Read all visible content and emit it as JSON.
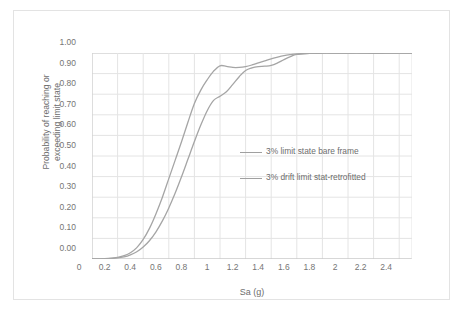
{
  "chart_data": {
    "type": "line",
    "title": "",
    "xlabel": "Sa (g)",
    "ylabel": "Probability of reaching or exceeding limit state",
    "ylabel_line1": "Probability of reaching or",
    "ylabel_line2": "exceeding limit state",
    "xlim": [
      0,
      2.5
    ],
    "ylim": [
      0,
      1.0
    ],
    "grid": true,
    "legend_position": "inside-right",
    "x_ticks": [
      "0",
      "0.2",
      "0.4",
      "0.6",
      "0.8",
      "1",
      "1.2",
      "1.4",
      "1.6",
      "1.8",
      "2",
      "2.2",
      "2.4"
    ],
    "x_tick_values": [
      0,
      0.2,
      0.4,
      0.6,
      0.8,
      1.0,
      1.2,
      1.4,
      1.6,
      1.8,
      2.0,
      2.2,
      2.4
    ],
    "y_ticks": [
      "0.00",
      "0.10",
      "0.20",
      "0.30",
      "0.40",
      "0.50",
      "0.60",
      "0.70",
      "0.80",
      "0.90",
      "1.00"
    ],
    "y_tick_values": [
      0,
      0.1,
      0.2,
      0.3,
      0.4,
      0.5,
      0.6,
      0.7,
      0.8,
      0.9,
      1.0
    ],
    "series": [
      {
        "name": "3% limit state bare frame",
        "color": "#a5a5a5",
        "x": [
          0.0,
          0.1,
          0.2,
          0.25,
          0.3,
          0.35,
          0.4,
          0.45,
          0.5,
          0.55,
          0.6,
          0.65,
          0.7,
          0.75,
          0.8,
          0.85,
          0.9,
          0.95,
          1.0,
          1.05,
          1.1,
          1.15,
          1.2,
          1.25,
          1.3,
          1.35,
          1.4,
          1.45,
          1.5,
          1.55,
          1.6,
          1.7,
          1.8,
          1.9,
          2.0,
          2.1,
          2.2,
          2.3,
          2.4,
          2.5
        ],
        "y": [
          0.0,
          0.002,
          0.008,
          0.016,
          0.03,
          0.055,
          0.095,
          0.15,
          0.22,
          0.3,
          0.39,
          0.48,
          0.57,
          0.665,
          0.755,
          0.82,
          0.87,
          0.912,
          0.938,
          0.935,
          0.93,
          0.93,
          0.934,
          0.942,
          0.952,
          0.962,
          0.972,
          0.98,
          0.987,
          0.992,
          0.996,
          0.998,
          0.999,
          1.0,
          1.0,
          1.0,
          0.998,
          0.999,
          1.0,
          1.0
        ]
      },
      {
        "name": "3% drift limit stat-retrofitted",
        "color": "#a5a5a5",
        "x": [
          0.0,
          0.1,
          0.2,
          0.25,
          0.3,
          0.35,
          0.4,
          0.45,
          0.5,
          0.55,
          0.6,
          0.65,
          0.7,
          0.75,
          0.8,
          0.85,
          0.9,
          0.95,
          1.0,
          1.05,
          1.1,
          1.15,
          1.2,
          1.25,
          1.3,
          1.35,
          1.4,
          1.45,
          1.5,
          1.55,
          1.6,
          1.7,
          1.8,
          1.9,
          2.0,
          2.1,
          2.2,
          2.3,
          2.4,
          2.5
        ],
        "y": [
          0.0,
          0.001,
          0.005,
          0.01,
          0.02,
          0.035,
          0.058,
          0.09,
          0.132,
          0.185,
          0.248,
          0.32,
          0.4,
          0.485,
          0.57,
          0.65,
          0.72,
          0.77,
          0.79,
          0.812,
          0.848,
          0.885,
          0.915,
          0.928,
          0.934,
          0.936,
          0.94,
          0.952,
          0.968,
          0.982,
          0.993,
          0.998,
          1.0,
          1.0,
          1.0,
          1.0,
          1.0,
          1.0,
          1.0,
          1.0
        ]
      }
    ]
  },
  "legend": {
    "items": [
      {
        "label": "3% limit state bare frame"
      },
      {
        "label": "3% drift limit stat-retrofitted"
      }
    ]
  }
}
